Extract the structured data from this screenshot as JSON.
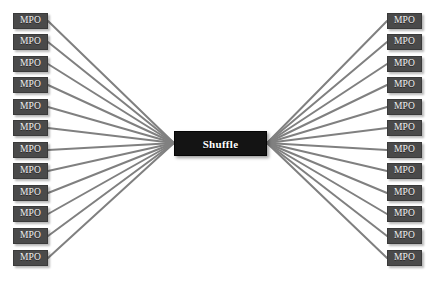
{
  "diagram": {
    "background_color": "#ffffff",
    "node_color": "#4a4a4a",
    "hub_color": "#141414",
    "edge_color": "#808080",
    "text_color": "#f2f2f2",
    "hub": {
      "label": "Shuffle",
      "x": 174,
      "y": 131,
      "width": 93,
      "height": 25,
      "left_port": {
        "x": 174,
        "y": 143
      },
      "right_port": {
        "x": 267,
        "y": 143
      }
    },
    "node_size": {
      "width": 35,
      "height": 16
    },
    "left_column": {
      "name": "left-mpo-column",
      "x": 13,
      "count": 12,
      "nodes": [
        {
          "label": "MPO",
          "y": 13
        },
        {
          "label": "MPO",
          "y": 34
        },
        {
          "label": "MPO",
          "y": 56
        },
        {
          "label": "MPO",
          "y": 77
        },
        {
          "label": "MPO",
          "y": 99
        },
        {
          "label": "MPO",
          "y": 120
        },
        {
          "label": "MPO",
          "y": 142
        },
        {
          "label": "MPO",
          "y": 163
        },
        {
          "label": "MPO",
          "y": 185
        },
        {
          "label": "MPO",
          "y": 206
        },
        {
          "label": "MPO",
          "y": 228
        },
        {
          "label": "MPO",
          "y": 250
        }
      ]
    },
    "right_column": {
      "name": "right-mpo-column",
      "x": 387,
      "count": 12,
      "nodes": [
        {
          "label": "MPO",
          "y": 13
        },
        {
          "label": "MPO",
          "y": 34
        },
        {
          "label": "MPO",
          "y": 56
        },
        {
          "label": "MPO",
          "y": 77
        },
        {
          "label": "MPO",
          "y": 99
        },
        {
          "label": "MPO",
          "y": 120
        },
        {
          "label": "MPO",
          "y": 142
        },
        {
          "label": "MPO",
          "y": 163
        },
        {
          "label": "MPO",
          "y": 185
        },
        {
          "label": "MPO",
          "y": 206
        },
        {
          "label": "MPO",
          "y": 228
        },
        {
          "label": "MPO",
          "y": 250
        }
      ]
    },
    "edges": {
      "stroke_width": 2,
      "left_count": 12,
      "right_count": 12,
      "description": "Every left MPO connects to the Shuffle hub left port; every right MPO connects to the Shuffle hub right port."
    }
  }
}
